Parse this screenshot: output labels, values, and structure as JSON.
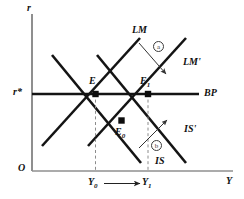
{
  "figure": {
    "type": "is-lm-bp-diagram",
    "axes": {
      "y_axis_label": "r",
      "x_axis_label": "Y",
      "origin_label": "O",
      "y_tick_label": "r*"
    },
    "curves": [
      {
        "id": "LM",
        "label": "LM",
        "slope": "upward",
        "state": "initial"
      },
      {
        "id": "LM1",
        "label": "LM'",
        "slope": "upward",
        "state": "shifted"
      },
      {
        "id": "IS",
        "label": "IS",
        "slope": "downward",
        "state": "initial"
      },
      {
        "id": "IS1",
        "label": "IS'",
        "slope": "downward",
        "state": "shifted"
      },
      {
        "id": "BP",
        "label": "BP",
        "slope": "horizontal",
        "state": "fixed"
      }
    ],
    "points": [
      {
        "id": "E",
        "label": "E",
        "sub": ""
      },
      {
        "id": "E1",
        "label": "E",
        "sub": "1"
      },
      {
        "id": "E0",
        "label": "E",
        "sub": "0"
      }
    ],
    "annotations": [
      {
        "id": "a",
        "marker": "a",
        "describes": "LM shifts right to LM'"
      },
      {
        "id": "b",
        "marker": "b",
        "describes": "IS shifts right to IS'"
      }
    ],
    "x_ticks": [
      {
        "id": "Y0",
        "label": "Y",
        "sub": "0"
      },
      {
        "id": "Y1",
        "label": "Y",
        "sub": "1"
      }
    ],
    "x_shift_arrow": "⟶",
    "colors": {
      "curve": "#1a1a1a",
      "axis": "#8a8a8a",
      "annotation": "#3c3c3c",
      "guide": "#909090",
      "background": "#ffffff"
    }
  }
}
